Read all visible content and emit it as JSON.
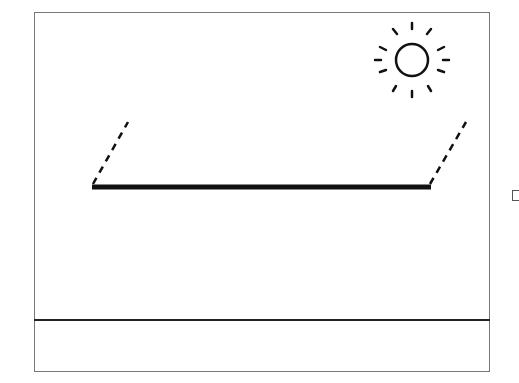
{
  "diagram": {
    "elements": {
      "sun": {
        "icon": "sun-icon",
        "cx": 412,
        "cy": 60,
        "r": 16,
        "rays": 12
      },
      "slab": {
        "x1": 92,
        "x2": 431,
        "y": 187,
        "thickness": 5
      },
      "left_support": {
        "style": "dashed",
        "from": [
          92,
          185
        ],
        "to": [
          128,
          122
        ]
      },
      "right_support": {
        "style": "dashed",
        "from": [
          431,
          185
        ],
        "to": [
          467,
          122
        ]
      },
      "ground_line": {
        "y": 320
      }
    },
    "colors": {
      "stroke": "#111111",
      "frame": "#777777",
      "background": "#ffffff"
    }
  }
}
